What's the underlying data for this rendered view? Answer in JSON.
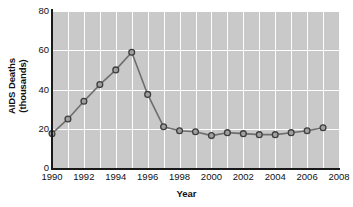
{
  "chart_data": {
    "type": "line",
    "title": "",
    "xlabel": "Year",
    "ylabel": "AIDS Deaths (thousands)",
    "ylabel_line1": "AIDS Deaths",
    "ylabel_line2": "(thousands)",
    "xlim": [
      1990,
      2008
    ],
    "ylim": [
      0,
      80
    ],
    "ytick_labels": [
      "0",
      "20",
      "40",
      "60",
      "80"
    ],
    "ytick_values": [
      0,
      20,
      40,
      60,
      80
    ],
    "xtick_labels": [
      "1990",
      "1992",
      "1994",
      "1996",
      "1998",
      "2000",
      "2002",
      "2004",
      "2006",
      "2008"
    ],
    "xtick_values": [
      1990,
      1992,
      1994,
      1996,
      1998,
      2000,
      2002,
      2004,
      2006,
      2008
    ],
    "grid": true,
    "grid_x_step": 1,
    "grid_y_step": 20,
    "legend": "none",
    "plot_background": "#c9c9c9",
    "gridline_color": "#fdfdfd",
    "line_color": "#6e6e6e",
    "marker_fill": "#a0a0a0",
    "marker_edge": "#3d3d3d",
    "axis_color": "#1a1a1a",
    "x": [
      1990,
      1991,
      1992,
      1993,
      1994,
      1995,
      1996,
      1997,
      1998,
      1999,
      2000,
      2001,
      2002,
      2003,
      2004,
      2005,
      2006,
      2007
    ],
    "values": [
      17.5,
      25,
      34,
      42.5,
      50,
      59,
      37.5,
      21,
      19,
      18.5,
      16.5,
      18,
      17.5,
      17,
      17,
      18,
      19,
      20.5
    ],
    "series": [
      {
        "name": "AIDS Deaths",
        "values": [
          17.5,
          25,
          34,
          42.5,
          50,
          59,
          37.5,
          21,
          19,
          18.5,
          16.5,
          18,
          17.5,
          17,
          17,
          18,
          19,
          20.5
        ]
      }
    ]
  }
}
